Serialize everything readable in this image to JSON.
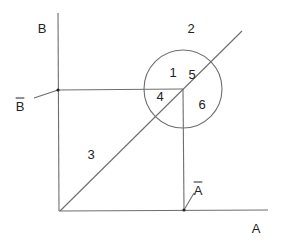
{
  "diagram": {
    "colors": {
      "line": "#6e6e6e",
      "text": "#222222",
      "background": "#ffffff"
    },
    "axes": {
      "x_label": "A",
      "y_label": "B",
      "origin": [
        60,
        211
      ],
      "x_end": [
        268,
        210
      ],
      "y_end": [
        58,
        13
      ]
    },
    "diagonal": {
      "from": [
        60,
        211
      ],
      "to": [
        242,
        31
      ]
    },
    "circle": {
      "center": [
        183,
        89
      ],
      "radius": 39
    },
    "projection_point": [
      183,
      89
    ],
    "markers": {
      "b_bar": {
        "label": "B",
        "overline": true,
        "point": [
          58,
          90
        ],
        "pointer_from": [
          34,
          98
        ]
      },
      "a_bar": {
        "label": "A",
        "overline": true,
        "point": [
          184,
          210
        ],
        "pointer_to": [
          194,
          193
        ]
      }
    },
    "regions": [
      {
        "id": "1",
        "label": "1",
        "pos": [
          173,
          72
        ]
      },
      {
        "id": "2",
        "label": "2",
        "pos": [
          191,
          28
        ]
      },
      {
        "id": "3",
        "label": "3",
        "pos": [
          91,
          154
        ]
      },
      {
        "id": "4",
        "label": "4",
        "pos": [
          160,
          96
        ]
      },
      {
        "id": "5",
        "label": "5",
        "pos": [
          192,
          74
        ]
      },
      {
        "id": "6",
        "label": "6",
        "pos": [
          202,
          104
        ]
      }
    ],
    "label_positions": {
      "y_label": [
        42,
        28
      ],
      "x_label": [
        256,
        228
      ],
      "b_bar": [
        20,
        106
      ],
      "a_bar": [
        198,
        190
      ]
    }
  }
}
